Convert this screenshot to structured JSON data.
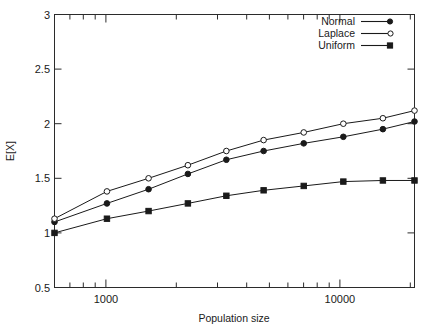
{
  "chart_data": {
    "type": "line",
    "title": "",
    "xlabel": "Population size",
    "ylabel": "E[X]",
    "xscale": "log",
    "yscale": "linear",
    "xlim": [
      600,
      20000
    ],
    "ylim": [
      0.5,
      3
    ],
    "grid": false,
    "legend_position": "top-right",
    "y_ticks": [
      "0.5",
      "1",
      "1.5",
      "2",
      "2.5",
      "3"
    ],
    "y_tick_values": [
      0.5,
      1,
      1.5,
      2,
      2.5,
      3
    ],
    "x_ticks": [
      "1000",
      "10000"
    ],
    "x_tick_values": [
      1000,
      10000
    ],
    "x": [
      600,
      1000,
      1500,
      2200,
      3200,
      4600,
      6800,
      10000,
      14700,
      20000
    ],
    "series": [
      {
        "name": "Normal",
        "marker": "filled-circle",
        "values": [
          1.1,
          1.27,
          1.4,
          1.54,
          1.67,
          1.75,
          1.82,
          1.88,
          1.95,
          2.02
        ]
      },
      {
        "name": "Laplace",
        "marker": "open-circle",
        "values": [
          1.13,
          1.38,
          1.5,
          1.62,
          1.75,
          1.85,
          1.92,
          2.0,
          2.05,
          2.12
        ]
      },
      {
        "name": "Uniform",
        "marker": "filled-square",
        "values": [
          1.0,
          1.13,
          1.2,
          1.27,
          1.34,
          1.39,
          1.43,
          1.47,
          1.48,
          1.48
        ]
      }
    ]
  },
  "legend": {
    "entries": [
      {
        "label": "Normal"
      },
      {
        "label": "Laplace"
      },
      {
        "label": "Uniform"
      }
    ]
  },
  "axes": {
    "x_title": "Population size",
    "y_title": "E[X]",
    "y_tick_0": "0.5",
    "y_tick_1": "1",
    "y_tick_2": "1.5",
    "y_tick_3": "2",
    "y_tick_4": "2.5",
    "y_tick_5": "3",
    "x_tick_0": "1000",
    "x_tick_1": "10000"
  },
  "colors": {
    "axis": "#2b2b2b",
    "series": "#1a1a1a",
    "background": "#ffffff"
  }
}
